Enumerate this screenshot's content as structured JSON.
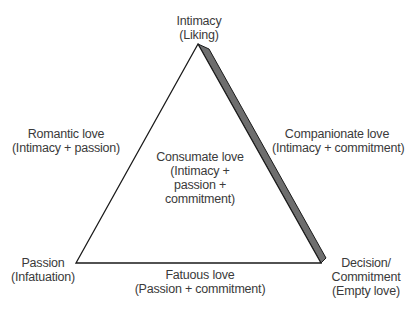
{
  "diagram": {
    "type": "triangular-theory-of-love",
    "vertices": {
      "top": {
        "line1": "Intimacy",
        "line2": "(Liking)"
      },
      "left": {
        "line1": "Passion",
        "line2": "(Infatuation)"
      },
      "right": {
        "line1": "Decision/",
        "line2": "Commitment",
        "line3": "(Empty love)"
      }
    },
    "edges": {
      "left": {
        "line1": "Romantic love",
        "line2": "(Intimacy + passion)"
      },
      "right": {
        "line1": "Companionate love",
        "line2": "(Intimacy + commitment)"
      },
      "bottom": {
        "line1": "Fatuous love",
        "line2": "(Passion + commitment)"
      }
    },
    "center": {
      "line1": "Consumate love",
      "line2": "(Intimacy +",
      "line3": "passion +",
      "line4": "commitment)"
    },
    "colors": {
      "stroke": "#1a1a1a",
      "shade": "#6e6e6e",
      "text": "#3a3a3a",
      "background": "#ffffff"
    }
  }
}
